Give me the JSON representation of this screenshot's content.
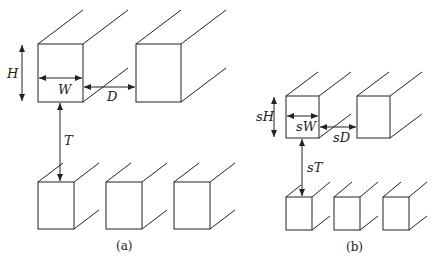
{
  "panel_a": {
    "caption": "(a)",
    "labels": {
      "H": "H",
      "W": "W",
      "D": "D",
      "T": "T"
    }
  },
  "panel_b": {
    "caption": "(b)",
    "labels": {
      "H": "sH",
      "W": "sW",
      "D": "sD",
      "T": "sT"
    }
  },
  "colors": {
    "stroke": "#222222",
    "background": "#ffffff"
  }
}
